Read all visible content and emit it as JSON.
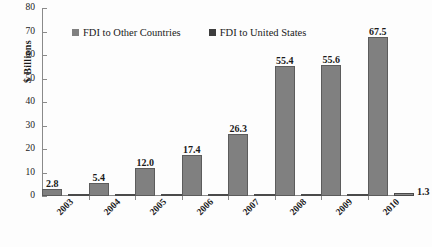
{
  "chart_data": {
    "type": "bar",
    "title": "",
    "xlabel": "",
    "ylabel": "$ Billions",
    "ylim": [
      0,
      80
    ],
    "yticks": [
      0,
      10,
      20,
      30,
      40,
      50,
      60,
      70,
      80
    ],
    "grid": false,
    "legend_position": "top",
    "categories": [
      "2003",
      "2004",
      "2005",
      "2006",
      "2007",
      "2008",
      "2009",
      "2010"
    ],
    "series": [
      {
        "name": "FDI to Other Countries",
        "color": "#808080",
        "values": [
          2.8,
          5.4,
          12.0,
          17.4,
          26.3,
          55.4,
          55.6,
          67.5
        ],
        "labels": [
          "2.8",
          "5.4",
          "12.0",
          "17.4",
          "26.3",
          "55.4",
          "55.6",
          "67.5"
        ]
      },
      {
        "name": "FDI to United States",
        "color": "#3d3d3d",
        "values": [
          0.1,
          0.1,
          0.2,
          0.2,
          0.2,
          0.5,
          0.9,
          1.3
        ],
        "labels": [
          "0.1",
          "0.1",
          "0.2",
          "0.2",
          "0.2",
          "0.5",
          "0.9",
          "1.3"
        ]
      }
    ]
  },
  "axis": {
    "y_title": "$ Billions",
    "y_tick_labels": [
      "80",
      "70",
      "60",
      "50",
      "40",
      "30",
      "20",
      "10",
      "0"
    ]
  },
  "legend": {
    "items": [
      {
        "label": "FDI to Other Countries",
        "swatch": "legend-swatch-gray"
      },
      {
        "label": "FDI to United States",
        "swatch": "legend-swatch-dark"
      }
    ]
  }
}
